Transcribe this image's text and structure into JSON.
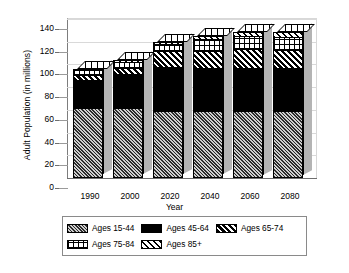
{
  "chart_data": {
    "type": "bar",
    "stacked": true,
    "title": "",
    "xlabel": "Year",
    "ylabel": "Adult Population (in millions)",
    "categories": [
      "1990",
      "2000",
      "2020",
      "2040",
      "2060",
      "2080"
    ],
    "ylim": [
      0,
      140
    ],
    "yticks": [
      0,
      20,
      40,
      60,
      80,
      100,
      120,
      140
    ],
    "grid": true,
    "legend_position": "bottom",
    "series": [
      {
        "name": "Ages 15-44",
        "values": [
          61,
          61,
          58,
          58,
          58,
          58
        ],
        "pattern": "dark-diagonal-hatch",
        "color": "#2b2b2b"
      },
      {
        "name": "Ages 45-64",
        "values": [
          25,
          31,
          40,
          39,
          39,
          39
        ],
        "pattern": "solid-black",
        "color": "#000000"
      },
      {
        "name": "Ages 65-74",
        "values": [
          5,
          5,
          14,
          15,
          17,
          16
        ],
        "pattern": "bold-diagonal-stripes",
        "color": "#000000"
      },
      {
        "name": "Ages 75-84",
        "values": [
          4,
          5,
          6,
          10,
          11,
          11
        ],
        "pattern": "grid-crosshatch",
        "color": "#ffffff"
      },
      {
        "name": "Ages 85+",
        "values": [
          1,
          2,
          2,
          3,
          4,
          5
        ],
        "pattern": "light-diagonal-hatch",
        "color": "#ffffff"
      }
    ],
    "totals": [
      96,
      104,
      120,
      125,
      129,
      129
    ]
  },
  "legend": {
    "items": [
      {
        "label": "Ages 15-44"
      },
      {
        "label": "Ages 45-64"
      },
      {
        "label": "Ages 65-74"
      },
      {
        "label": "Ages 75-84"
      },
      {
        "label": "Ages 85+"
      }
    ]
  }
}
